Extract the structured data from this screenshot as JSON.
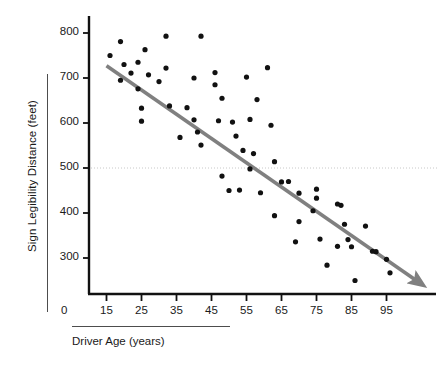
{
  "chart_data": {
    "type": "scatter",
    "title": "",
    "xlabel": "Driver Age (years)",
    "ylabel": "Sign Legibility Distance (feet)",
    "xlim": [
      10,
      108
    ],
    "ylim": [
      220,
      820
    ],
    "xticks": [
      15,
      25,
      35,
      45,
      55,
      65,
      75,
      85,
      95
    ],
    "yticks": [
      300,
      400,
      500,
      600,
      700,
      800
    ],
    "origin_label": "0",
    "grid": false,
    "legend": null,
    "point_color": "#111111",
    "trendline_color": "#808080",
    "reference_line": {
      "orientation": "horizontal",
      "value": 500,
      "style": "dotted",
      "color": "#c8c8c8"
    },
    "trendline": {
      "style": "solid-arrow",
      "x_start": 15,
      "y_start": 727,
      "x_end": 103,
      "y_end": 253
    },
    "series": [
      {
        "name": "Drivers",
        "points": [
          [
            16,
            750
          ],
          [
            19,
            781
          ],
          [
            19,
            695
          ],
          [
            20,
            730
          ],
          [
            22,
            711
          ],
          [
            24,
            735
          ],
          [
            24,
            676
          ],
          [
            25,
            633
          ],
          [
            25,
            604
          ],
          [
            26,
            763
          ],
          [
            27,
            707
          ],
          [
            30,
            692
          ],
          [
            32,
            793
          ],
          [
            32,
            722
          ],
          [
            33,
            638
          ],
          [
            36,
            568
          ],
          [
            38,
            634
          ],
          [
            40,
            700
          ],
          [
            40,
            607
          ],
          [
            41,
            580
          ],
          [
            42,
            793
          ],
          [
            42,
            551
          ],
          [
            46,
            712
          ],
          [
            46,
            685
          ],
          [
            47,
            605
          ],
          [
            48,
            655
          ],
          [
            48,
            482
          ],
          [
            50,
            450
          ],
          [
            51,
            602
          ],
          [
            52,
            571
          ],
          [
            53,
            451
          ],
          [
            54,
            539
          ],
          [
            55,
            702
          ],
          [
            56,
            608
          ],
          [
            56,
            498
          ],
          [
            57,
            532
          ],
          [
            58,
            652
          ],
          [
            59,
            445
          ],
          [
            61,
            723
          ],
          [
            62,
            595
          ],
          [
            63,
            514
          ],
          [
            63,
            394
          ],
          [
            65,
            469
          ],
          [
            67,
            470
          ],
          [
            69,
            336
          ],
          [
            70,
            444
          ],
          [
            70,
            381
          ],
          [
            74,
            405
          ],
          [
            75,
            453
          ],
          [
            75,
            433
          ],
          [
            76,
            342
          ],
          [
            78,
            284
          ],
          [
            81,
            420
          ],
          [
            81,
            326
          ],
          [
            82,
            417
          ],
          [
            83,
            375
          ],
          [
            84,
            341
          ],
          [
            85,
            325
          ],
          [
            86,
            250
          ],
          [
            89,
            371
          ],
          [
            91,
            315
          ],
          [
            92,
            314
          ],
          [
            95,
            297
          ],
          [
            96,
            267
          ]
        ]
      }
    ]
  }
}
